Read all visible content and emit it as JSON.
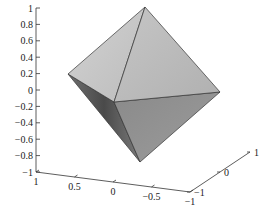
{
  "chart_data": {
    "type": "surface3d",
    "title": "",
    "xlabel": "",
    "ylabel": "",
    "zlabel": "",
    "xlim": [
      -1,
      1
    ],
    "ylim": [
      -1,
      1
    ],
    "zlim": [
      -1,
      1
    ],
    "grid": false,
    "legend": null,
    "vertices": [
      {
        "name": "top",
        "x": 0,
        "y": 0,
        "z": 1
      },
      {
        "name": "bottom",
        "x": 0,
        "y": 0,
        "z": -1
      },
      {
        "name": "left",
        "x": 1,
        "y": 0,
        "z": 0
      },
      {
        "name": "right",
        "x": -1,
        "y": 0,
        "z": 0
      },
      {
        "name": "front",
        "x": 0,
        "y": -1,
        "z": 0
      },
      {
        "name": "back",
        "x": 0,
        "y": 1,
        "z": 0
      }
    ],
    "z_ticks": [
      "1",
      "0.8",
      "0.6",
      "0.4",
      "0.2",
      "0",
      "−0.2",
      "−0.4",
      "−0.6",
      "−0.8",
      "−1"
    ],
    "x_ticks": [
      "1",
      "0.5",
      "0",
      "−0.5",
      "−1"
    ],
    "y_ticks": [
      "−1",
      "0",
      "1"
    ]
  },
  "colors": {
    "face_upper_left": "#c9c9c9",
    "face_upper_right": "#bdbdbd",
    "face_lower_left": "#8e8e8e",
    "face_lower_right": "#9a9a9a",
    "edge": "#333333"
  }
}
